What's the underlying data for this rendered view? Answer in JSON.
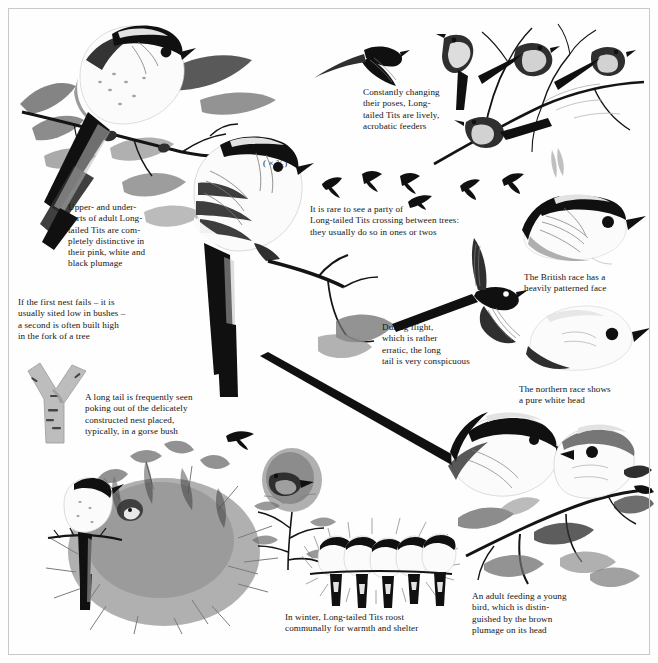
{
  "plate": {
    "title": "Long-tailed Tit illustrated plate",
    "background_color": "#fefefe",
    "frame_color": "#c9c9c9",
    "ink_color": "#141414"
  },
  "scale_note": {
    "label": "( × ³⁄₅)"
  },
  "captions": [
    {
      "id": "adult-plumage",
      "text": "Upper- and under-\nparts of adult Long-\ntailed Tits are com-\npletely distinctive in\ntheir pink, white and\nblack plumage"
    },
    {
      "id": "second-nest",
      "text": "If the first nest fails – it is\nusually sited low in bushes –\na second is often built high\nin the fork of a tree"
    },
    {
      "id": "long-tail-nest",
      "text": "A long tail is frequently seen\npoking out of the delicately\nconstructed nest placed,\ntypically, in a gorse bush"
    },
    {
      "id": "acrobatic-feeders",
      "text": "Constantly changing\ntheir poses, Long-\ntailed Tits are lively,\nacrobatic feeders"
    },
    {
      "id": "crossing-between-trees",
      "text": "It is rare to see a party of\nLong-tailed Tits crossing between trees:\nthey usually do so in ones or twos"
    },
    {
      "id": "during-flight",
      "text": "During flight,\nwhich is rather\nerratic, the long\ntail is very conspicuous"
    },
    {
      "id": "british-race",
      "text": "The British race has a\nheavily patterned face"
    },
    {
      "id": "northern-race",
      "text": "The northern race shows\na pure white head"
    },
    {
      "id": "winter-roost",
      "text": "In winter, Long-tailed Tits roost\ncommunally for warmth and shelter"
    },
    {
      "id": "adult-feeding-young",
      "text": "An adult feeding a young\nbird, which is distin-\nguished by the brown\nplumage on its head"
    }
  ],
  "illustrations": [
    {
      "id": "perched-adult-upperparts",
      "name": "Adult Long-tailed Tit perched on hawthorn spray, upperparts"
    },
    {
      "id": "perched-adult-underparts",
      "name": "Adult Long-tailed Tit perched on branch, underparts"
    },
    {
      "id": "flying-tit-upper",
      "name": "Long-tailed Tit in flight, wings spread"
    },
    {
      "id": "branch-party",
      "name": "Four Long-tailed Tits in acrobatic poses on bare winter branch"
    },
    {
      "id": "flight-silhouettes",
      "name": "Six small flight silhouettes crossing between trees"
    },
    {
      "id": "flight-long-tail",
      "name": "Long-tailed Tit in flight showing long tail and fanned wings"
    },
    {
      "id": "head-british-race",
      "name": "Head study, British race with heavily patterned face"
    },
    {
      "id": "head-northern-race",
      "name": "Head study, northern race with pure white head"
    },
    {
      "id": "birch-fork",
      "name": "Fork of a birch tree where a second nest is built"
    },
    {
      "id": "gorse-bush-nest",
      "name": "Domed nest in gorse bush with adult perched, tail protruding"
    },
    {
      "id": "nest-in-thorn",
      "name": "Nest wedged in a thorn bush with bird at entrance"
    },
    {
      "id": "winter-roost-row",
      "name": "Five Long-tailed Tits roosting in a row on a twig"
    },
    {
      "id": "adult-and-juvenile",
      "name": "Adult feeding a young bird on a leafy branch"
    }
  ]
}
